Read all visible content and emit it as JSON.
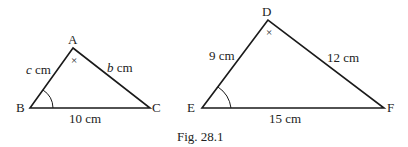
{
  "figure": {
    "caption": "Fig. 28.1",
    "triangle_abc": {
      "vertices": {
        "A": "A",
        "B": "B",
        "C": "C"
      },
      "sides": {
        "ab": {
          "var": "c",
          "unit": " cm"
        },
        "ac": {
          "var": "b",
          "unit": " cm"
        },
        "bc": "10 cm"
      },
      "angle_marks": {
        "A": "×",
        "B": "arc"
      }
    },
    "triangle_def": {
      "vertices": {
        "D": "D",
        "E": "E",
        "F": "F"
      },
      "sides": {
        "de": "9 cm",
        "df": "12 cm",
        "ef": "15 cm"
      },
      "angle_marks": {
        "D": "×",
        "E": "arc"
      }
    },
    "colors": {
      "stroke": "#1a1a1a",
      "text": "#222222"
    }
  }
}
